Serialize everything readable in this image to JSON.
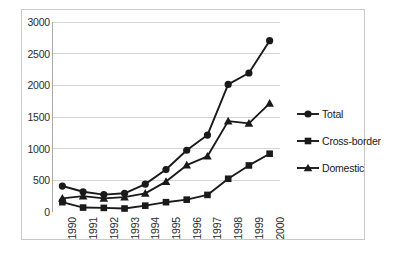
{
  "chart_data": {
    "type": "line",
    "title": "",
    "xlabel": "",
    "ylabel": "",
    "x": [
      "1990",
      "1991",
      "1992",
      "1993",
      "1994",
      "1995",
      "1996",
      "1997",
      "1998",
      "1999",
      "2000"
    ],
    "categories": [
      "1990",
      "1991",
      "1992",
      "1993",
      "1994",
      "1995",
      "1996",
      "1997",
      "1998",
      "1999",
      "2000"
    ],
    "ylim": [
      0,
      3000
    ],
    "yticks": [
      "0",
      "500",
      "1000",
      "1500",
      "2000",
      "2500",
      "3000"
    ],
    "ytick_values": [
      0,
      500,
      1000,
      1500,
      2000,
      2500,
      3000
    ],
    "grid": "horizontal",
    "legend_position": "right",
    "series": [
      {
        "name": "Total",
        "marker": "circle",
        "color": "#1a1a1a",
        "values": [
          410,
          320,
          275,
          295,
          440,
          670,
          975,
          1215,
          2015,
          2195,
          2705
        ]
      },
      {
        "name": "Cross-border",
        "marker": "square",
        "color": "#1a1a1a",
        "values": [
          155,
          70,
          65,
          55,
          100,
          155,
          195,
          270,
          525,
          735,
          920
        ]
      },
      {
        "name": "Domestic",
        "marker": "triangle",
        "color": "#1a1a1a",
        "values": [
          215,
          250,
          215,
          235,
          295,
          480,
          740,
          880,
          1435,
          1400,
          1715
        ]
      }
    ]
  },
  "legend": {
    "items": [
      {
        "label": "Total",
        "marker": "circle"
      },
      {
        "label": "Cross-border",
        "marker": "square"
      },
      {
        "label": "Domestic",
        "marker": "triangle"
      }
    ]
  },
  "colors": {
    "series": "#1a1a1a",
    "gridline": "#d4d4d4",
    "axis": "#a8a8a8",
    "frame": "#c8c8c8",
    "background": "#ffffff",
    "text": "#2b2b2b"
  }
}
